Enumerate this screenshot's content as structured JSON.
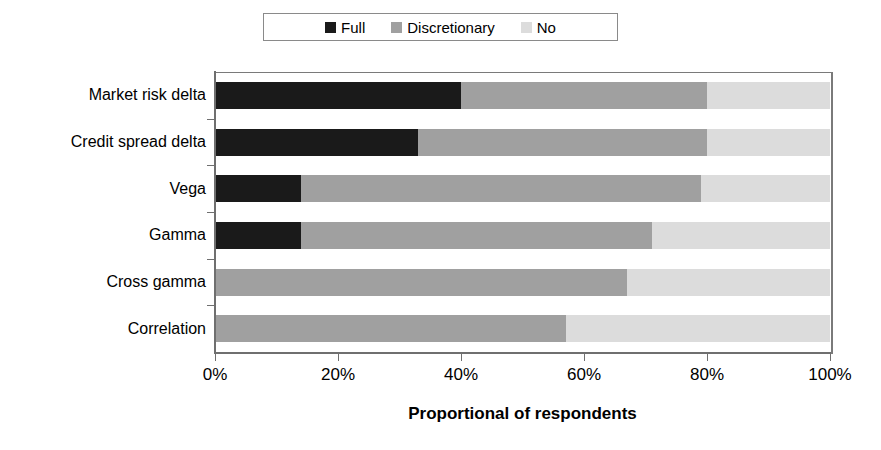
{
  "chart_data": {
    "type": "bar",
    "orientation": "horizontal",
    "stacked": true,
    "title": "",
    "xlabel": "Proportional of respondents",
    "ylabel": "",
    "xlim": [
      0,
      100
    ],
    "xticks": [
      "0%",
      "20%",
      "40%",
      "60%",
      "80%",
      "100%"
    ],
    "xtick_values": [
      0,
      20,
      40,
      60,
      80,
      100
    ],
    "grid": false,
    "legend_position": "top-center",
    "categories": [
      "Market risk delta",
      "Credit spread delta",
      "Vega",
      "Gamma",
      "Cross gamma",
      "Correlation"
    ],
    "series": [
      {
        "name": "Full",
        "color": "#1a1a1a",
        "values": [
          40,
          33,
          14,
          14,
          0,
          0
        ]
      },
      {
        "name": "Discretionary",
        "color": "#a0a0a0",
        "values": [
          40,
          47,
          65,
          57,
          67,
          57
        ]
      },
      {
        "name": "No",
        "color": "#dcdcdc",
        "values": [
          20,
          20,
          21,
          29,
          33,
          43
        ]
      }
    ]
  },
  "legend": {
    "items": [
      {
        "label": "Full",
        "color": "#1a1a1a"
      },
      {
        "label": "Discretionary",
        "color": "#a0a0a0"
      },
      {
        "label": "No",
        "color": "#dcdcdc"
      }
    ]
  },
  "axis": {
    "x_title": "Proportional of respondents",
    "x_tick_labels": [
      "0%",
      "20%",
      "40%",
      "60%",
      "80%",
      "100%"
    ]
  },
  "colors": {
    "background": "#ffffff",
    "axis": "#6f6f6f",
    "frame": "#7a7a7a",
    "text": "#000000"
  }
}
